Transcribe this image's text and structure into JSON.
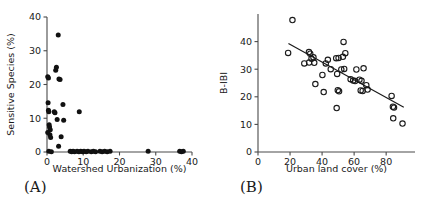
{
  "figure": {
    "background": "#ffffff",
    "point_color": "#111111",
    "axis_color": "#4a4a4a",
    "line_color": "#1a1a1a"
  },
  "chart_data": [
    {
      "type": "scatter",
      "panel_label": "(A)",
      "title": "",
      "xlabel": "Watershed Urbanization (%)",
      "ylabel": "Sensitive Species (%)",
      "xlim": [
        0,
        40
      ],
      "ylim": [
        0,
        40
      ],
      "xticks": [
        0,
        10,
        20,
        30,
        40
      ],
      "yticks": [
        0,
        10,
        20,
        30,
        40
      ],
      "xticklabels": [
        "0",
        "10",
        "20",
        "30",
        "40"
      ],
      "yticklabels": [
        "0",
        "10",
        "20",
        "30",
        "40"
      ],
      "grid": false,
      "legend": "none",
      "marker": "filled-circle",
      "points": [
        [
          0.2,
          22.3
        ],
        [
          0.4,
          21.9
        ],
        [
          3.1,
          34.7
        ],
        [
          2.4,
          24.2
        ],
        [
          2.6,
          25.1
        ],
        [
          3.3,
          21.6
        ],
        [
          3.6,
          21.5
        ],
        [
          0.3,
          14.6
        ],
        [
          0.5,
          11.9
        ],
        [
          0.4,
          12.4
        ],
        [
          0.6,
          8.1
        ],
        [
          0.7,
          7.4
        ],
        [
          0.9,
          6.6
        ],
        [
          0.8,
          5.1
        ],
        [
          0.2,
          5.8
        ],
        [
          1.0,
          4.3
        ],
        [
          2.2,
          11.6
        ],
        [
          2.0,
          11.9
        ],
        [
          4.4,
          14.1
        ],
        [
          4.6,
          9.4
        ],
        [
          2.8,
          9.6
        ],
        [
          3.9,
          4.5
        ],
        [
          3.2,
          1.7
        ],
        [
          8.9,
          11.9
        ],
        [
          0.5,
          0.2
        ],
        [
          1.2,
          0.1
        ],
        [
          6.4,
          0.2
        ],
        [
          6.8,
          0.1
        ],
        [
          7.2,
          0.2
        ],
        [
          7.6,
          0.1
        ],
        [
          8.3,
          0.2
        ],
        [
          8.8,
          0.1
        ],
        [
          9.3,
          0.2
        ],
        [
          9.8,
          0.1
        ],
        [
          10.2,
          0.2
        ],
        [
          10.8,
          0.1
        ],
        [
          11.3,
          0.2
        ],
        [
          12.2,
          0.1
        ],
        [
          12.8,
          0.2
        ],
        [
          13.4,
          0.1
        ],
        [
          14.6,
          0.2
        ],
        [
          15.2,
          0.1
        ],
        [
          15.9,
          0.2
        ],
        [
          16.6,
          0.1
        ],
        [
          17.4,
          0.2
        ],
        [
          27.9,
          0.2
        ],
        [
          36.6,
          0.2
        ],
        [
          37.1,
          0.1
        ],
        [
          37.6,
          0.2
        ]
      ]
    },
    {
      "type": "scatter",
      "panel_label": "(B)",
      "title": "",
      "xlabel": "Urban land cover (%)",
      "ylabel": "B-IBI",
      "xlim": [
        0,
        98
      ],
      "ylim": [
        0,
        50
      ],
      "xticks": [
        0,
        20,
        40,
        60,
        80
      ],
      "yticks": [
        0,
        10,
        20,
        30,
        40
      ],
      "xticklabels": [
        "0",
        "20",
        "40",
        "60",
        "80"
      ],
      "yticklabels": [
        "0",
        "10",
        "20",
        "30",
        "40"
      ],
      "grid": false,
      "legend": "none",
      "marker": "open-circle",
      "points": [
        [
          21.5,
          47.8
        ],
        [
          18.8,
          35.9
        ],
        [
          28.9,
          32.1
        ],
        [
          31.8,
          36.2
        ],
        [
          32.6,
          35.6
        ],
        [
          33.4,
          33.8
        ],
        [
          34.6,
          34.3
        ],
        [
          31.9,
          32.4
        ],
        [
          35.1,
          32.3
        ],
        [
          35.8,
          24.6
        ],
        [
          40.2,
          27.9
        ],
        [
          42.3,
          32.1
        ],
        [
          43.6,
          33.4
        ],
        [
          45.4,
          30.0
        ],
        [
          41.0,
          21.7
        ],
        [
          48.8,
          34.0
        ],
        [
          50.3,
          34.1
        ],
        [
          49.4,
          28.3
        ],
        [
          49.8,
          22.4
        ],
        [
          50.6,
          22.0
        ],
        [
          49.1,
          15.9
        ],
        [
          52.0,
          29.9
        ],
        [
          53.4,
          39.9
        ],
        [
          53.0,
          34.5
        ],
        [
          54.5,
          35.8
        ],
        [
          53.8,
          30.1
        ],
        [
          57.8,
          26.4
        ],
        [
          59.4,
          25.9
        ],
        [
          60.6,
          25.7
        ],
        [
          61.4,
          29.9
        ],
        [
          63.3,
          26.2
        ],
        [
          64.6,
          25.8
        ],
        [
          64.1,
          22.3
        ],
        [
          65.3,
          22.1
        ],
        [
          65.9,
          30.3
        ],
        [
          67.6,
          24.2
        ],
        [
          68.4,
          22.6
        ],
        [
          83.4,
          20.3
        ],
        [
          84.2,
          16.4
        ],
        [
          84.9,
          16.1
        ],
        [
          84.4,
          12.2
        ],
        [
          90.2,
          10.3
        ]
      ],
      "fit_line": {
        "x": [
          19.0,
          91.0
        ],
        "y": [
          39.3,
          16.2
        ]
      }
    }
  ]
}
